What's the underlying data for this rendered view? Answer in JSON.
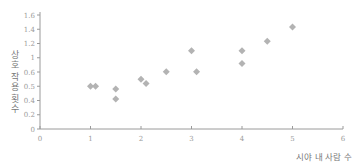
{
  "chart_data": {
    "type": "scatter",
    "title": "",
    "xlabel": "시야 내 사람 수",
    "ylabel": "상호 작용 횟수",
    "xlim": [
      0,
      6
    ],
    "ylim": [
      0,
      1.6
    ],
    "grid": false,
    "legend": null,
    "x_ticks": [
      "0",
      "1",
      "2",
      "3",
      "4",
      "5",
      "6"
    ],
    "y_ticks": [
      "0",
      "0.2",
      "0.4",
      "0.5",
      "0.6",
      "1",
      "1.2",
      "1.4",
      "1.6"
    ],
    "marker_color": "#b3b3b3",
    "series": [
      {
        "name": "points",
        "points": [
          {
            "x": 1.0,
            "y": 0.5
          },
          {
            "x": 1.1,
            "y": 0.5
          },
          {
            "x": 1.5,
            "y": 0.48
          },
          {
            "x": 1.5,
            "y": 0.41
          },
          {
            "x": 2.0,
            "y": 0.55
          },
          {
            "x": 2.1,
            "y": 0.52
          },
          {
            "x": 2.5,
            "y": 0.61
          },
          {
            "x": 3.0,
            "y": 1.1
          },
          {
            "x": 3.1,
            "y": 0.61
          },
          {
            "x": 4.0,
            "y": 1.1
          },
          {
            "x": 4.0,
            "y": 0.84
          },
          {
            "x": 4.5,
            "y": 1.23
          },
          {
            "x": 5.0,
            "y": 1.43
          }
        ]
      }
    ]
  }
}
